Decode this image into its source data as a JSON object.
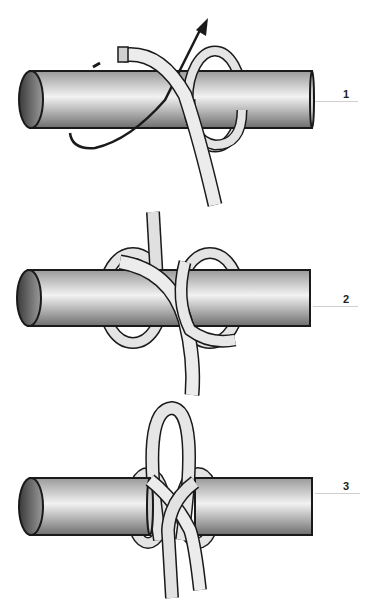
{
  "steps": [
    {
      "label": "1",
      "description": "Pass rope end over bar, wrap around, and bring up (arrow indicates direction)"
    },
    {
      "label": "2",
      "description": "Rope forms figure-eight crossing around the bar"
    },
    {
      "label": "3",
      "description": "Loop pulled up through the center to finish the hitch"
    }
  ],
  "colors": {
    "outline": "#1a1a1a",
    "bar_dark": "#7a7a7a",
    "bar_light": "#e8e8e8",
    "rope": "#e6e6e6",
    "rope_shadow": "#c8c8c8",
    "leader_line": "#cfcfcf"
  }
}
